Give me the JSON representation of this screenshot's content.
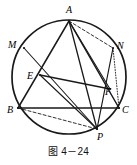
{
  "figure": {
    "type": "geometry-diagram",
    "caption": "图 4－24",
    "stroke_color": "#1a1a1a",
    "background_color": "#ffffff",
    "circle": {
      "cx": 69,
      "cy": 77,
      "r": 57
    },
    "points": [
      {
        "id": "A",
        "x": 69,
        "y": 21,
        "label": "A",
        "label_x": 66,
        "label_y": 13,
        "on_circle": true
      },
      {
        "id": "M",
        "x": 24,
        "y": 48,
        "label": "M",
        "label_x": 8,
        "label_y": 48,
        "on_circle": true
      },
      {
        "id": "N",
        "x": 113,
        "y": 48,
        "label": "N",
        "label_x": 117,
        "label_y": 49,
        "on_circle": true
      },
      {
        "id": "E",
        "x": 40,
        "y": 75,
        "label": "E",
        "label_x": 27,
        "label_y": 79,
        "on_circle": false
      },
      {
        "id": "F",
        "x": 110,
        "y": 89,
        "label": "F",
        "label_x": 105,
        "label_y": 95,
        "on_circle": false
      },
      {
        "id": "B",
        "x": 18,
        "y": 108,
        "label": "B",
        "label_x": 7,
        "label_y": 113,
        "on_circle": true
      },
      {
        "id": "C",
        "x": 119,
        "y": 108,
        "label": "C",
        "label_x": 122,
        "label_y": 113,
        "on_circle": true
      },
      {
        "id": "P",
        "x": 97,
        "y": 129,
        "label": "P",
        "label_x": 97,
        "label_y": 140,
        "on_circle": true
      }
    ],
    "segments": [
      {
        "name": "A-B",
        "from": "A",
        "to": "B",
        "style": "solid",
        "width": 1.5
      },
      {
        "name": "A-C",
        "from": "A",
        "to": "C",
        "style": "solid",
        "width": 1.5
      },
      {
        "name": "B-C",
        "from": "B",
        "to": "C",
        "style": "solid",
        "width": 1.5
      },
      {
        "name": "A-P",
        "from": "A",
        "to": "P",
        "style": "solid",
        "width": 1.3
      },
      {
        "name": "A-F",
        "from": "A",
        "to": "F",
        "style": "solid",
        "width": 1.1
      },
      {
        "name": "A-N",
        "from": "A",
        "to": "N",
        "style": "dashed",
        "width": 0.9
      },
      {
        "name": "M-P",
        "from": "M",
        "to": "P",
        "style": "solid",
        "width": 1.1
      },
      {
        "name": "E-F",
        "from": "E",
        "to": "F",
        "style": "solid",
        "width": 1.3
      },
      {
        "name": "E-P",
        "from": "E",
        "to": "P",
        "style": "solid",
        "width": 1.1
      },
      {
        "name": "N-P",
        "from": "N",
        "to": "P",
        "style": "solid",
        "width": 1.2
      },
      {
        "name": "B-P",
        "from": "B",
        "to": "P",
        "style": "dashed",
        "width": 0.9
      },
      {
        "name": "N-C",
        "from": "N",
        "to": "C",
        "style": "dotted",
        "width": 0.9
      }
    ]
  }
}
